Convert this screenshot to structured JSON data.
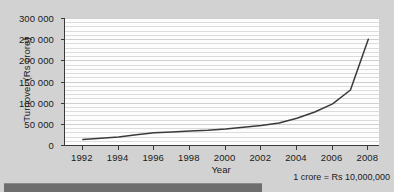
{
  "chart_data": {
    "type": "line",
    "title": "",
    "xlabel": "Year",
    "ylabel": "Turnover (Rs crore)",
    "xlim": [
      1991,
      2008.6
    ],
    "ylim": [
      0,
      300000
    ],
    "grid": true,
    "legend": false,
    "x_ticks": [
      "1992",
      "1994",
      "1996",
      "1998",
      "2000",
      "2002",
      "2004",
      "2006",
      "2008"
    ],
    "x_tick_values": [
      1992,
      1994,
      1996,
      1998,
      2000,
      2002,
      2004,
      2006,
      2008
    ],
    "y_ticks": [
      "0",
      "50 000",
      "100 000",
      "150 000",
      "200 000",
      "250 000",
      "300 000"
    ],
    "y_tick_values": [
      0,
      50000,
      100000,
      150000,
      200000,
      250000,
      300000
    ],
    "x": [
      1992,
      1993,
      1994,
      1995,
      1996,
      1997,
      1998,
      1999,
      2000,
      2001,
      2002,
      2003,
      2004,
      2005,
      2006,
      2007,
      2008
    ],
    "values": [
      13000,
      16000,
      19000,
      24000,
      29000,
      31000,
      33000,
      35000,
      38000,
      42000,
      46000,
      52000,
      63000,
      78000,
      97000,
      130000,
      250000
    ],
    "series": [
      {
        "name": "Turnover",
        "values": [
          13000,
          16000,
          19000,
          24000,
          29000,
          31000,
          33000,
          35000,
          38000,
          42000,
          46000,
          52000,
          63000,
          78000,
          97000,
          130000,
          250000
        ],
        "color": "#3a3a3a"
      }
    ]
  },
  "axes": {
    "y_title": "Turnover (Rs crore)",
    "x_title": "Year"
  },
  "footnote": {
    "text": "1 crore = Rs 10,000,000"
  },
  "colors": {
    "page_background": "#d2d2d2",
    "plot_background": "#fdfdfd",
    "line": "#3a3a3a",
    "gridline": "#dcdcdc",
    "axis": "#3a3a3a",
    "bottom_bar": "#6e6e6e"
  }
}
